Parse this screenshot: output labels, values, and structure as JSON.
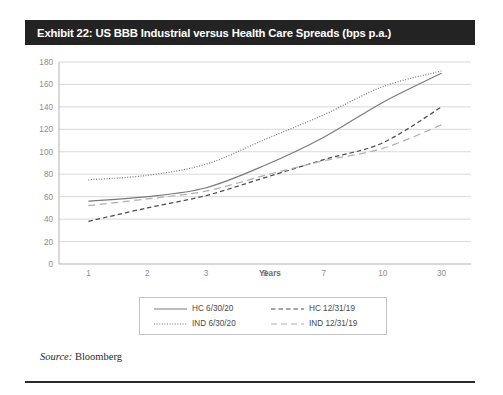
{
  "exhibit": {
    "title": "Exhibit 22: US BBB Industrial versus Health Care Spreads (bps p.a.)",
    "source": "Bloomberg",
    "source_prefix": "Source:"
  },
  "legend": {
    "items": [
      {
        "label": "HC 6/30/20",
        "style": "solid",
        "color": "#7a7a7a",
        "key": "hc-6-30-20"
      },
      {
        "label": "HC 12/31/19",
        "style": "dashed",
        "color": "#4d4d4d",
        "key": "hc-12-31-19"
      },
      {
        "label": "IND 6/30/20",
        "style": "dotted",
        "color": "#6e6e6e",
        "key": "ind-6-30-20"
      },
      {
        "label": "IND 12/31/19",
        "style": "long-dash",
        "color": "#b0b0b0",
        "key": "ind-12-31-19"
      }
    ]
  },
  "chart_data": {
    "type": "line",
    "title": "Exhibit 22: US BBB Industrial versus Health Care Spreads (bps p.a.)",
    "xlabel": "Years",
    "ylabel": "",
    "categories": [
      "1",
      "2",
      "3",
      "5",
      "7",
      "10",
      "30"
    ],
    "ylim": [
      0,
      180
    ],
    "yticks": [
      0,
      20,
      40,
      60,
      80,
      100,
      120,
      140,
      160,
      180
    ],
    "grid": true,
    "legend_position": "bottom",
    "series": [
      {
        "name": "HC 6/30/20",
        "style": "solid",
        "color": "#7a7a7a",
        "values": [
          56,
          60,
          68,
          88,
          113,
          144,
          170
        ]
      },
      {
        "name": "IND 6/30/20",
        "style": "dotted",
        "color": "#6e6e6e",
        "values": [
          75,
          79,
          89,
          111,
          133,
          158,
          172
        ]
      },
      {
        "name": "HC 12/31/19",
        "style": "dashed",
        "color": "#4d4d4d",
        "values": [
          38,
          50,
          61,
          77,
          93,
          108,
          140
        ]
      },
      {
        "name": "IND 12/31/19",
        "style": "long-dash",
        "color": "#b0b0b0",
        "values": [
          52,
          58,
          65,
          79,
          92,
          103,
          124
        ]
      }
    ]
  }
}
